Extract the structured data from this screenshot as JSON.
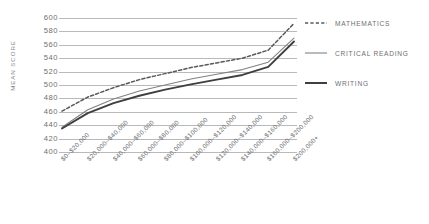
{
  "chart_data": {
    "type": "line",
    "title": "",
    "xlabel": "",
    "ylabel": "MEAN SCORE",
    "ylim": [
      400,
      600
    ],
    "ytick_step": 20,
    "yticks": [
      600,
      580,
      560,
      540,
      520,
      500,
      480,
      460,
      440,
      420,
      400
    ],
    "grid": true,
    "legend_position": "right",
    "categories": [
      "$0–$20,000",
      "$20,000–$40,000",
      "$40,000–$60,000",
      "$60,000–$80,000",
      "$80,000–$100,000",
      "$100,000–$120,000",
      "$120,000–$140,000",
      "$140,000–$160,000",
      "$160,000–$200,000",
      "$200,000+"
    ],
    "series": [
      {
        "name": "MATHEMATICS",
        "style": "dashed",
        "color": "#58595b",
        "values": [
          461,
          482,
          496,
          508,
          517,
          526,
          533,
          540,
          552,
          592
        ]
      },
      {
        "name": "CRITICAL READING",
        "style": "solid-thin",
        "color": "#808285",
        "values": [
          437,
          463,
          479,
          491,
          500,
          509,
          516,
          523,
          534,
          570
        ]
      },
      {
        "name": "WRITING",
        "style": "solid-thick",
        "color": "#3f3f41",
        "values": [
          435,
          458,
          473,
          484,
          493,
          501,
          508,
          515,
          527,
          565
        ]
      }
    ]
  },
  "legend": {
    "items": [
      {
        "label": "MATHEMATICS"
      },
      {
        "label": "CRITICAL READING"
      },
      {
        "label": "WRITING"
      }
    ]
  },
  "colors": {
    "grid": "#b7b9bb",
    "tick_text": "#6d6e71",
    "axis_label": "#8a8c8e",
    "background": "#ffffff"
  }
}
